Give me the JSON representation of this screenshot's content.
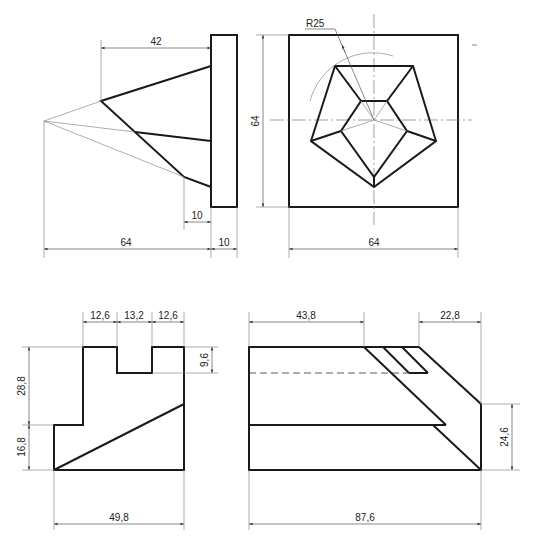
{
  "drawing": {
    "type": "orthographic technical drawing",
    "views": [
      {
        "id": "top-left",
        "name": "pyramid side view on plate"
      },
      {
        "id": "top-right",
        "name": "pentagon front view in square"
      },
      {
        "id": "bottom-left",
        "name": "stepped block side view"
      },
      {
        "id": "bottom-right",
        "name": "stepped block front view"
      }
    ]
  },
  "dimensions": {
    "top_left": {
      "apex_offset": "42",
      "overall_length": "64",
      "plate_thickness": "10",
      "inner_offset": "10"
    },
    "top_right": {
      "radius": "R25",
      "height": "64",
      "width": "64"
    },
    "bottom_left": {
      "slot_left": "12,6",
      "slot_width": "13,2",
      "slot_right": "12,6",
      "slot_depth": "9,6",
      "upper_height": "28,8",
      "lower_height": "16,8",
      "width": "49,8"
    },
    "bottom_right": {
      "left_length": "43,8",
      "right_length": "22,8",
      "right_height": "24,6",
      "overall_length": "87,6"
    }
  },
  "colors": {
    "outline": "#1a1a1a",
    "thin_line": "#8a8a8a",
    "background": "#ffffff"
  }
}
